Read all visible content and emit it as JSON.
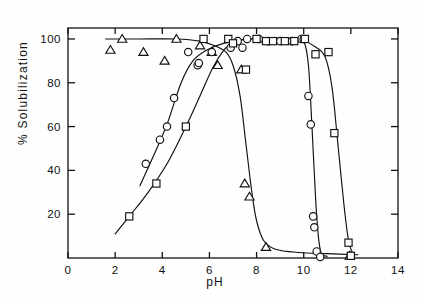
{
  "figure": {
    "name": "ph-solubilization-plot",
    "background": "#fefefe",
    "ink": "#111111"
  },
  "chart_data": {
    "type": "scatter",
    "title": "",
    "xlabel": "pH",
    "ylabel": "% Solubilization",
    "xlim": [
      0,
      14
    ],
    "ylim": [
      0,
      105
    ],
    "xticks": [
      0,
      2,
      4,
      6,
      8,
      10,
      12,
      14
    ],
    "xticklabels": [
      "0",
      "2",
      "4",
      "6",
      "8",
      "10",
      "12",
      "14"
    ],
    "yticks": [
      20,
      40,
      60,
      80,
      100
    ],
    "yticklabels": [
      "20",
      "40",
      "60",
      "80",
      "100"
    ],
    "grid": false,
    "legend": "none",
    "frame": "box",
    "series": [
      {
        "name": "triangle-series",
        "marker": "triangle",
        "points": [
          {
            "x": 1.8,
            "y": 95
          },
          {
            "x": 2.3,
            "y": 100
          },
          {
            "x": 3.2,
            "y": 94
          },
          {
            "x": 4.1,
            "y": 90
          },
          {
            "x": 4.6,
            "y": 100
          },
          {
            "x": 5.6,
            "y": 97
          },
          {
            "x": 6.1,
            "y": 94
          },
          {
            "x": 6.35,
            "y": 88
          },
          {
            "x": 7.35,
            "y": 86
          },
          {
            "x": 7.5,
            "y": 34
          },
          {
            "x": 7.7,
            "y": 28
          },
          {
            "x": 8.4,
            "y": 5
          },
          {
            "x": 11.95,
            "y": 1
          }
        ],
        "curve": [
          {
            "x": 1.6,
            "y": 100
          },
          {
            "x": 3.0,
            "y": 100
          },
          {
            "x": 4.6,
            "y": 100
          },
          {
            "x": 5.6,
            "y": 99
          },
          {
            "x": 6.2,
            "y": 97
          },
          {
            "x": 6.7,
            "y": 94
          },
          {
            "x": 7.0,
            "y": 88
          },
          {
            "x": 7.3,
            "y": 74
          },
          {
            "x": 7.55,
            "y": 52
          },
          {
            "x": 7.8,
            "y": 30
          },
          {
            "x": 8.0,
            "y": 17
          },
          {
            "x": 8.3,
            "y": 8
          },
          {
            "x": 8.8,
            "y": 4
          },
          {
            "x": 9.8,
            "y": 2.5
          },
          {
            "x": 11.0,
            "y": 2
          },
          {
            "x": 12.3,
            "y": 1.5
          }
        ]
      },
      {
        "name": "circle-series",
        "marker": "circle",
        "points": [
          {
            "x": 3.3,
            "y": 43
          },
          {
            "x": 3.9,
            "y": 54
          },
          {
            "x": 4.2,
            "y": 60
          },
          {
            "x": 4.5,
            "y": 73
          },
          {
            "x": 5.1,
            "y": 94
          },
          {
            "x": 5.5,
            "y": 88
          },
          {
            "x": 5.55,
            "y": 89
          },
          {
            "x": 6.1,
            "y": 94
          },
          {
            "x": 6.9,
            "y": 96
          },
          {
            "x": 7.2,
            "y": 99
          },
          {
            "x": 7.4,
            "y": 96
          },
          {
            "x": 7.6,
            "y": 100
          },
          {
            "x": 8.1,
            "y": 100
          },
          {
            "x": 8.5,
            "y": 99
          },
          {
            "x": 9.0,
            "y": 99
          },
          {
            "x": 9.5,
            "y": 99
          },
          {
            "x": 9.9,
            "y": 100
          },
          {
            "x": 10.0,
            "y": 100
          },
          {
            "x": 10.2,
            "y": 74
          },
          {
            "x": 10.3,
            "y": 61
          },
          {
            "x": 10.4,
            "y": 19
          },
          {
            "x": 10.45,
            "y": 14
          },
          {
            "x": 10.55,
            "y": 3
          },
          {
            "x": 10.7,
            "y": 0.5
          }
        ],
        "curve": [
          {
            "x": 3.05,
            "y": 33
          },
          {
            "x": 3.6,
            "y": 46
          },
          {
            "x": 4.2,
            "y": 61
          },
          {
            "x": 4.8,
            "y": 80
          },
          {
            "x": 5.3,
            "y": 90
          },
          {
            "x": 5.9,
            "y": 95
          },
          {
            "x": 6.6,
            "y": 98
          },
          {
            "x": 7.6,
            "y": 100
          },
          {
            "x": 8.8,
            "y": 100
          },
          {
            "x": 9.6,
            "y": 100
          },
          {
            "x": 10.0,
            "y": 99
          },
          {
            "x": 10.2,
            "y": 88
          },
          {
            "x": 10.35,
            "y": 60
          },
          {
            "x": 10.5,
            "y": 28
          },
          {
            "x": 10.62,
            "y": 10
          },
          {
            "x": 10.75,
            "y": 2
          },
          {
            "x": 11.0,
            "y": 0.8
          }
        ]
      },
      {
        "name": "square-series",
        "marker": "square",
        "points": [
          {
            "x": 2.6,
            "y": 19
          },
          {
            "x": 3.75,
            "y": 34
          },
          {
            "x": 5.0,
            "y": 60
          },
          {
            "x": 5.75,
            "y": 100
          },
          {
            "x": 6.8,
            "y": 100
          },
          {
            "x": 7.0,
            "y": 98
          },
          {
            "x": 7.55,
            "y": 86
          },
          {
            "x": 8.0,
            "y": 100
          },
          {
            "x": 8.4,
            "y": 99
          },
          {
            "x": 8.7,
            "y": 99
          },
          {
            "x": 9.2,
            "y": 99
          },
          {
            "x": 9.6,
            "y": 99
          },
          {
            "x": 10.05,
            "y": 100
          },
          {
            "x": 10.5,
            "y": 93
          },
          {
            "x": 11.05,
            "y": 94
          },
          {
            "x": 11.3,
            "y": 57
          },
          {
            "x": 11.9,
            "y": 7
          },
          {
            "x": 12.0,
            "y": 1
          }
        ],
        "curve": [
          {
            "x": 2.0,
            "y": 11
          },
          {
            "x": 2.6,
            "y": 19
          },
          {
            "x": 3.4,
            "y": 30
          },
          {
            "x": 4.2,
            "y": 43
          },
          {
            "x": 5.0,
            "y": 60
          },
          {
            "x": 5.6,
            "y": 74
          },
          {
            "x": 6.2,
            "y": 88
          },
          {
            "x": 6.8,
            "y": 97
          },
          {
            "x": 7.6,
            "y": 100
          },
          {
            "x": 8.8,
            "y": 100
          },
          {
            "x": 9.8,
            "y": 100
          },
          {
            "x": 10.4,
            "y": 97
          },
          {
            "x": 10.9,
            "y": 92
          },
          {
            "x": 11.2,
            "y": 78
          },
          {
            "x": 11.45,
            "y": 52
          },
          {
            "x": 11.7,
            "y": 25
          },
          {
            "x": 11.9,
            "y": 8
          },
          {
            "x": 12.1,
            "y": 1.5
          }
        ]
      }
    ]
  }
}
